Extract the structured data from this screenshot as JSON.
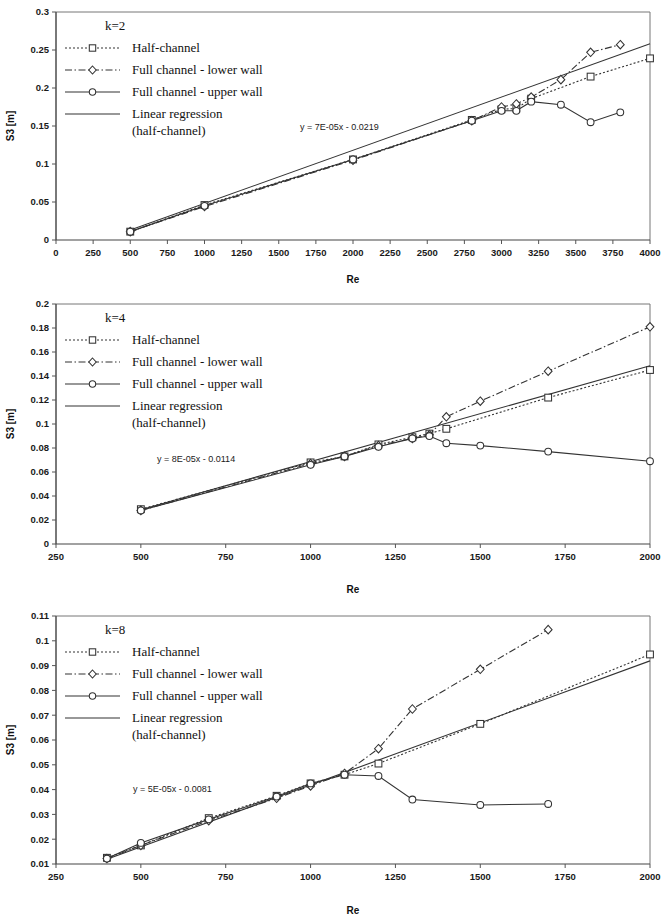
{
  "figure": {
    "panel_count": 3,
    "background": "#ffffff",
    "line_color": "#333333"
  },
  "legend_entries": [
    {
      "label": "Half-channel",
      "style": "dotted",
      "marker": "square"
    },
    {
      "label": "Full channel - lower wall",
      "style": "dashdot",
      "marker": "diamond"
    },
    {
      "label": "Full channel - upper wall",
      "style": "solid",
      "marker": "circle"
    },
    {
      "label": "Linear regression",
      "label2": "(half-channel)",
      "style": "solid",
      "marker": "none"
    }
  ],
  "chart_data": [
    {
      "type": "line",
      "panel": "top",
      "title": "k=2",
      "xlabel": "Re",
      "ylabel": "S3 [m]",
      "xlim": [
        0,
        4000
      ],
      "ylim": [
        0,
        0.3
      ],
      "xticks": [
        0,
        250,
        500,
        750,
        1000,
        1250,
        1500,
        1750,
        2000,
        2250,
        2500,
        2750,
        3000,
        3250,
        3500,
        3750,
        4000
      ],
      "yticks": [
        0,
        0.05,
        0.1,
        0.15,
        0.2,
        0.25,
        0.3
      ],
      "xtick_labels": [
        "0",
        "250",
        "500",
        "750",
        "1000",
        "1250",
        "1500",
        "1750",
        "2000",
        "2250",
        "2500",
        "2750",
        "3000",
        "3250",
        "3500",
        "3750",
        "4000"
      ],
      "ytick_labels": [
        "0",
        "0.05",
        "0.1",
        "0.15",
        "0.2",
        "0.25",
        "0.3"
      ],
      "grid": false,
      "annotation": "y = 7E-05x - 0.0219",
      "regression": {
        "slope": 7e-05,
        "intercept": -0.0219,
        "x_start": 500,
        "x_end": 4000
      },
      "series": [
        {
          "name": "Half-channel",
          "style": "dotted",
          "marker": "square",
          "x": [
            500,
            1000,
            2000,
            2800,
            3000,
            3100,
            3200,
            3600,
            4000
          ],
          "values": [
            0.011,
            0.046,
            0.106,
            0.158,
            0.172,
            0.173,
            0.186,
            0.215,
            0.239
          ]
        },
        {
          "name": "Full channel - lower wall",
          "style": "dashdot",
          "marker": "diamond",
          "x": [
            500,
            1000,
            2000,
            2800,
            3000,
            3100,
            3200,
            3400,
            3600,
            3800
          ],
          "values": [
            0.011,
            0.044,
            0.105,
            0.157,
            0.175,
            0.179,
            0.188,
            0.211,
            0.247,
            0.257
          ]
        },
        {
          "name": "Full channel - upper wall",
          "style": "solid",
          "marker": "circle",
          "x": [
            500,
            1000,
            2000,
            2800,
            3000,
            3100,
            3200,
            3400,
            3600,
            3800
          ],
          "values": [
            0.011,
            0.045,
            0.106,
            0.157,
            0.17,
            0.17,
            0.182,
            0.178,
            0.155,
            0.168
          ]
        }
      ]
    },
    {
      "type": "line",
      "panel": "middle",
      "title": "k=4",
      "xlabel": "Re",
      "ylabel": "S3 [m]",
      "xlim": [
        250,
        2000
      ],
      "ylim": [
        0,
        0.2
      ],
      "xticks": [
        250,
        500,
        750,
        1000,
        1250,
        1500,
        1750,
        2000
      ],
      "yticks": [
        0,
        0.02,
        0.04,
        0.06,
        0.08,
        0.1,
        0.12,
        0.14,
        0.16,
        0.18,
        0.2
      ],
      "xtick_labels": [
        "250",
        "500",
        "750",
        "1000",
        "1250",
        "1500",
        "1750",
        "2000"
      ],
      "ytick_labels": [
        "0",
        "0.02",
        "0.04",
        "0.06",
        "0.08",
        "0.1",
        "0.12",
        "0.14",
        "0.16",
        "0.18",
        "0.2"
      ],
      "grid": false,
      "annotation": "y = 8E-05x - 0.0114",
      "regression": {
        "slope": 8e-05,
        "intercept": -0.0114,
        "x_start": 500,
        "x_end": 2000
      },
      "series": [
        {
          "name": "Half-channel",
          "style": "dotted",
          "marker": "square",
          "x": [
            500,
            1000,
            1100,
            1200,
            1300,
            1350,
            1400,
            1700,
            2000
          ],
          "values": [
            0.029,
            0.068,
            0.073,
            0.083,
            0.089,
            0.092,
            0.096,
            0.122,
            0.145
          ]
        },
        {
          "name": "Full channel - lower wall",
          "style": "dashdot",
          "marker": "diamond",
          "x": [
            500,
            1000,
            1100,
            1200,
            1300,
            1350,
            1400,
            1500,
            1700,
            2000
          ],
          "values": [
            0.028,
            0.067,
            0.073,
            0.082,
            0.088,
            0.091,
            0.106,
            0.119,
            0.144,
            0.181
          ]
        },
        {
          "name": "Full channel - upper wall",
          "style": "solid",
          "marker": "circle",
          "x": [
            500,
            1000,
            1100,
            1200,
            1300,
            1350,
            1400,
            1500,
            1700,
            2000
          ],
          "values": [
            0.028,
            0.066,
            0.073,
            0.081,
            0.088,
            0.09,
            0.084,
            0.082,
            0.077,
            0.069
          ]
        }
      ]
    },
    {
      "type": "line",
      "panel": "bottom",
      "title": "k=8",
      "xlabel": "Re",
      "ylabel": "S3 [m]",
      "xlim": [
        250,
        2000
      ],
      "ylim": [
        0.01,
        0.11
      ],
      "xticks": [
        250,
        500,
        750,
        1000,
        1250,
        1500,
        1750,
        2000
      ],
      "yticks": [
        0.01,
        0.02,
        0.03,
        0.04,
        0.05,
        0.06,
        0.07,
        0.08,
        0.09,
        0.1,
        0.11
      ],
      "xtick_labels": [
        "250",
        "500",
        "750",
        "1000",
        "1250",
        "1500",
        "1750",
        "2000"
      ],
      "ytick_labels": [
        "0.01",
        "0.02",
        "0.03",
        "0.04",
        "0.05",
        "0.06",
        "0.07",
        "0.08",
        "0.09",
        "0.1",
        "0.11"
      ],
      "grid": false,
      "annotation": "y = 5E-05x - 0.0081",
      "regression": {
        "slope": 5e-05,
        "intercept": -0.0081,
        "x_start": 400,
        "x_end": 2000
      },
      "series": [
        {
          "name": "Half-channel",
          "style": "dotted",
          "marker": "square",
          "x": [
            400,
            500,
            700,
            900,
            1000,
            1100,
            1200,
            1500,
            2000
          ],
          "values": [
            0.0125,
            0.0175,
            0.0285,
            0.0375,
            0.0425,
            0.046,
            0.0505,
            0.0665,
            0.0945
          ]
        },
        {
          "name": "Full channel - lower wall",
          "style": "dashdot",
          "marker": "diamond",
          "x": [
            400,
            500,
            700,
            900,
            1000,
            1100,
            1200,
            1300,
            1500,
            1700
          ],
          "values": [
            0.0122,
            0.0175,
            0.0275,
            0.0365,
            0.0415,
            0.0465,
            0.0565,
            0.0725,
            0.0885,
            0.1045
          ]
        },
        {
          "name": "Full channel - upper wall",
          "style": "solid",
          "marker": "circle",
          "x": [
            400,
            500,
            700,
            900,
            1000,
            1100,
            1200,
            1300,
            1500,
            1700
          ],
          "values": [
            0.0122,
            0.0185,
            0.028,
            0.0372,
            0.0425,
            0.046,
            0.0455,
            0.036,
            0.0338,
            0.0342
          ]
        }
      ]
    }
  ]
}
